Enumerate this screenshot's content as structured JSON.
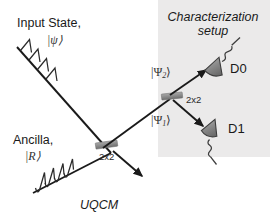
{
  "figure": {
    "type": "optical-schematic",
    "background_color": "#ffffff",
    "line_color": "#1a1a1a",
    "panel_fill": "#ebeaea",
    "beamsplitter_color": "#8c8c8c",
    "detector_color": "#7d7d7d"
  },
  "labels": {
    "input_state": "Input State,",
    "input_state_ket": "|ψ⟩",
    "ancilla": "Ancilla,",
    "ancilla_ket": "|R⟩",
    "uqcm": "UQCM",
    "characterization_line1": "Characterization",
    "characterization_line2": "setup",
    "bs1_label": "2x2",
    "bs2_label": "2x2",
    "psi1_ket_base": "|Ψ",
    "psi1_ket_sub": "1",
    "psi1_ket_close": "⟩",
    "psi2_ket_base": "|Ψ",
    "psi2_ket_sub": "2",
    "psi2_ket_close": "⟩",
    "detector0": "D0",
    "detector1": "D1"
  },
  "components": [
    {
      "name": "beamsplitter-uqcm",
      "label": "2x2",
      "x": 106,
      "y": 147
    },
    {
      "name": "beamsplitter-characterization",
      "label": "2x2",
      "x": 172,
      "y": 96
    },
    {
      "name": "detector-d0",
      "label": "D0",
      "x": 216,
      "y": 68
    },
    {
      "name": "detector-d1",
      "label": "D1",
      "x": 212,
      "y": 130
    }
  ],
  "beams": [
    {
      "name": "input-state-beam",
      "from": "top-left",
      "to": "beamsplitter-uqcm"
    },
    {
      "name": "ancilla-beam",
      "from": "bottom-left",
      "to": "beamsplitter-uqcm"
    },
    {
      "name": "clone-beam",
      "from": "beamsplitter-uqcm",
      "to": "beamsplitter-characterization"
    },
    {
      "name": "discarded-beam",
      "from": "beamsplitter-uqcm",
      "to": "bottom-right"
    },
    {
      "name": "psi2-beam",
      "from": "beamsplitter-characterization",
      "to": "detector-d0"
    },
    {
      "name": "psi1-beam",
      "from": "beamsplitter-characterization",
      "to": "detector-d1"
    }
  ]
}
